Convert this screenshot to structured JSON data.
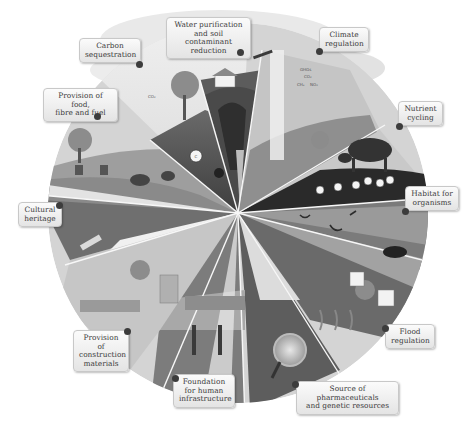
{
  "figure": {
    "type": "ecosystem-services-wheel",
    "color_mode": "grayscale",
    "center": [
      238,
      213
    ],
    "radius": 190
  },
  "services": [
    {
      "id": "carbon-sequestration",
      "label": "Carbon\nsequestration"
    },
    {
      "id": "water-purification",
      "label": "Water purification\nand soil contaminant\nreduction"
    },
    {
      "id": "climate-regulation",
      "label": "Climate\nregulation"
    },
    {
      "id": "nutrient-cycling",
      "label": "Nutrient\ncycling"
    },
    {
      "id": "habitat-for-organisms",
      "label": "Habitat for\norganisms"
    },
    {
      "id": "flood-regulation",
      "label": "Flood\nregulation"
    },
    {
      "id": "source-of-pharmaceuticals",
      "label": "Source of pharmaceuticals\nand genetic resources"
    },
    {
      "id": "foundation-for-infrastructure",
      "label": "Foundation\nfor human\ninfrastructure"
    },
    {
      "id": "provision-of-construction-materials",
      "label": "Provision of\nconstruction\nmaterials"
    },
    {
      "id": "cultural-heritage",
      "label": "Cultural\nheritage"
    },
    {
      "id": "provision-of-food",
      "label": "Provision of food,\nfibre and fuel"
    }
  ],
  "inline_text": {
    "co2_cloud": "CO₂",
    "carbon_marker": "C",
    "ghgs": "GHGs",
    "co2": "CO₂",
    "ch4": "CH₄",
    "n2o": "NO₂",
    "plane_drop": "PEF",
    "flood_sign_1": "DANGER",
    "flood_sign_2": "SAFE"
  }
}
